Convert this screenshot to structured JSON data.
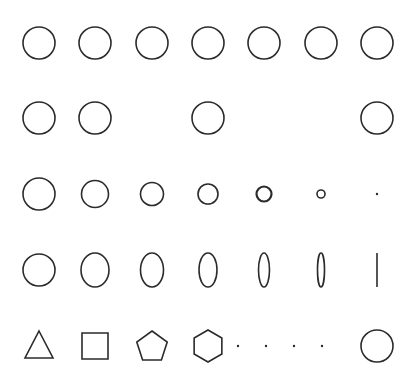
{
  "diagram": {
    "width": 419,
    "height": 385,
    "stroke_color": "#2b2b2b",
    "stroke_width": 1.6,
    "columns_x": [
      39,
      95,
      152,
      208,
      264,
      321,
      377
    ],
    "rows_y": [
      43,
      118,
      194,
      270,
      346
    ],
    "rows": [
      {
        "name": "row-full-circles",
        "items": [
          {
            "type": "circle",
            "col": 0,
            "rx": 16,
            "ry": 16
          },
          {
            "type": "circle",
            "col": 1,
            "rx": 16,
            "ry": 16
          },
          {
            "type": "circle",
            "col": 2,
            "rx": 16,
            "ry": 16
          },
          {
            "type": "circle",
            "col": 3,
            "rx": 16,
            "ry": 16
          },
          {
            "type": "circle",
            "col": 4,
            "rx": 16,
            "ry": 16
          },
          {
            "type": "circle",
            "col": 5,
            "rx": 16,
            "ry": 16
          },
          {
            "type": "circle",
            "col": 6,
            "rx": 16,
            "ry": 16
          }
        ]
      },
      {
        "name": "row-missing-circles",
        "items": [
          {
            "type": "circle",
            "col": 0,
            "rx": 16,
            "ry": 16
          },
          {
            "type": "circle",
            "col": 1,
            "rx": 16,
            "ry": 16
          },
          {
            "type": "circle",
            "col": 3,
            "rx": 16,
            "ry": 16
          },
          {
            "type": "circle",
            "col": 6,
            "rx": 16,
            "ry": 16
          }
        ]
      },
      {
        "name": "row-shrinking-circles",
        "items": [
          {
            "type": "circle",
            "col": 0,
            "rx": 16,
            "ry": 16
          },
          {
            "type": "circle",
            "col": 1,
            "rx": 13.5,
            "ry": 13.5
          },
          {
            "type": "circle",
            "col": 2,
            "rx": 11.5,
            "ry": 11.5
          },
          {
            "type": "circle",
            "col": 3,
            "rx": 10,
            "ry": 10
          },
          {
            "type": "circle",
            "col": 4,
            "rx": 7.5,
            "ry": 7.5,
            "stroke_width": 2.2
          },
          {
            "type": "circle",
            "col": 5,
            "rx": 4,
            "ry": 4
          },
          {
            "type": "dot",
            "col": 6,
            "r": 1.2
          }
        ]
      },
      {
        "name": "row-flattening-ellipses",
        "items": [
          {
            "type": "circle",
            "col": 0,
            "rx": 16,
            "ry": 16
          },
          {
            "type": "ellipse",
            "col": 1,
            "rx": 14,
            "ry": 17
          },
          {
            "type": "ellipse",
            "col": 2,
            "rx": 11.5,
            "ry": 17
          },
          {
            "type": "ellipse",
            "col": 3,
            "rx": 9,
            "ry": 17
          },
          {
            "type": "ellipse",
            "col": 4,
            "rx": 5.5,
            "ry": 17
          },
          {
            "type": "ellipse",
            "col": 5,
            "rx": 3.5,
            "ry": 17
          },
          {
            "type": "line",
            "col": 6,
            "ry": 17
          }
        ]
      },
      {
        "name": "row-polygons-to-circle",
        "items": [
          {
            "type": "polygon",
            "col": 0,
            "sides": 3,
            "label": "triangle"
          },
          {
            "type": "polygon",
            "col": 1,
            "sides": 4,
            "label": "square"
          },
          {
            "type": "polygon",
            "col": 2,
            "sides": 5,
            "label": "pentagon"
          },
          {
            "type": "polygon",
            "col": 3,
            "sides": 6,
            "label": "hexagon"
          },
          {
            "type": "ellipsis-dots",
            "xs": [
              238,
              266,
              294,
              322
            ]
          },
          {
            "type": "circle",
            "col": 6,
            "rx": 16,
            "ry": 16
          }
        ]
      }
    ]
  }
}
